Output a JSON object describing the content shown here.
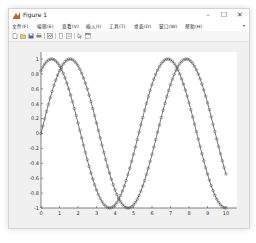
{
  "window": {
    "title": "Figure 1",
    "controls": {
      "minimize": "–",
      "maximize": "☐",
      "close": "✕"
    }
  },
  "menubar": {
    "items": [
      {
        "label": "文件(F)"
      },
      {
        "label": "编辑(E)"
      },
      {
        "label": "查看(V)"
      },
      {
        "label": "插入(I)"
      },
      {
        "label": "工具(T)"
      },
      {
        "label": "桌面(D)"
      },
      {
        "label": "窗口(W)"
      },
      {
        "label": "帮助(H)"
      }
    ],
    "overflow_arrow": "▾"
  },
  "toolbar": {
    "icons": [
      "new-figure-icon",
      "open-file-icon",
      "save-icon",
      "print-icon",
      "link-plot-icon",
      "insert-colorbar-icon",
      "insert-legend-icon",
      "edit-plot-arrow-icon",
      "open-property-inspector-icon"
    ]
  },
  "chart_data": {
    "type": "line",
    "title": "",
    "xlabel": "",
    "ylabel": "",
    "xlim": [
      0,
      10
    ],
    "ylim": [
      -1,
      1
    ],
    "xticks": [
      "0",
      "1",
      "2",
      "3",
      "4",
      "5",
      "6",
      "7",
      "8",
      "9",
      "10"
    ],
    "yticks": [
      "1",
      "0.8",
      "0.6",
      "0.4",
      "0.2",
      "0",
      "-0.2",
      "-0.4",
      "-0.6",
      "-0.8",
      "-1"
    ],
    "grid": false,
    "legend": null,
    "marker": "circle",
    "series": [
      {
        "name": "sin(x)",
        "expr": "sin(x)",
        "x_start": 0,
        "x_end": 10,
        "step": 0.1,
        "color": "#555555"
      },
      {
        "name": "sin(x+1)",
        "expr": "sin(x+1)",
        "x_start": 0,
        "x_end": 10,
        "step": 0.1,
        "color": "#555555"
      }
    ]
  }
}
